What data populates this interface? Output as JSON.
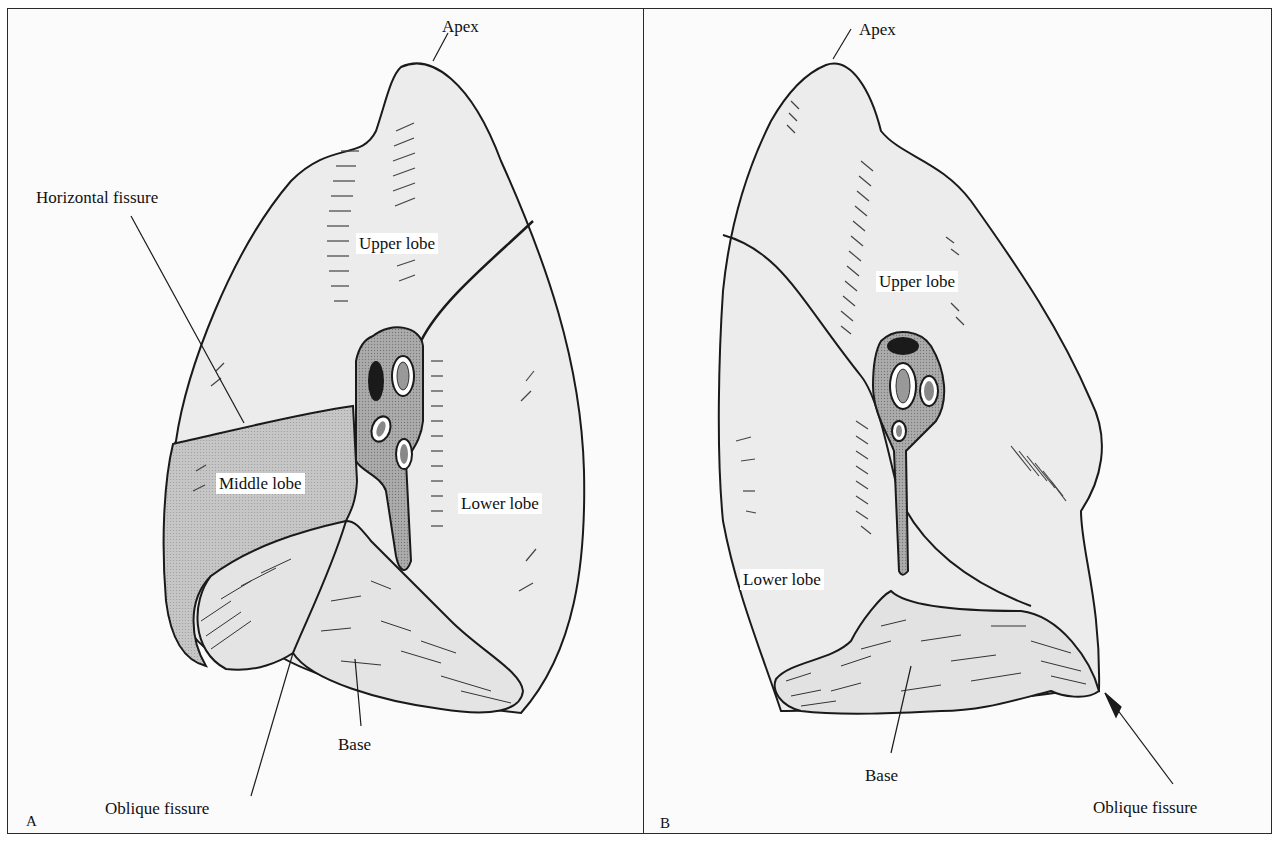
{
  "figure": {
    "colors": {
      "lung_fill": "#ececec",
      "middle_lobe_fill": "#c9c9c9",
      "hilum_fill": "#a8a8a8",
      "base_fill": "#e2e2e2",
      "outline": "#1a1a1a",
      "background": "#fbfbfb"
    }
  },
  "panels": [
    {
      "id": "A",
      "letter": "A",
      "labels": {
        "apex": "Apex",
        "horizontal_fissure": "Horizontal fissure",
        "upper_lobe": "Upper lobe",
        "middle_lobe": "Middle lobe",
        "lower_lobe": "Lower lobe",
        "base": "Base",
        "oblique_fissure": "Oblique fissure"
      }
    },
    {
      "id": "B",
      "letter": "B",
      "labels": {
        "apex": "Apex",
        "upper_lobe": "Upper lobe",
        "lower_lobe": "Lower lobe",
        "base": "Base",
        "oblique_fissure": "Oblique fissure"
      }
    }
  ]
}
